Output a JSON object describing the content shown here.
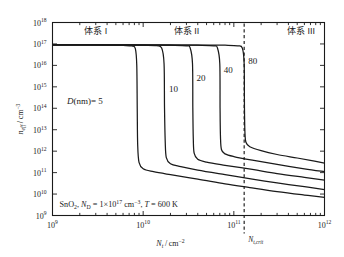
{
  "figure": {
    "top_caption": "",
    "background_color": "#ffffff",
    "line_color": "#1a1a1a"
  },
  "chart_data": {
    "type": "line",
    "title": "",
    "xlabel": "N_t / cm^-2",
    "ylabel": "n_eff / cm^-3",
    "xscale": "log",
    "yscale": "log",
    "xlim": [
      1000000000.0,
      1000000000000.0
    ],
    "ylim": [
      1000000000.0,
      1e+18
    ],
    "grid": false,
    "legend": "inline-annotations",
    "xtick_labels": [
      "10⁹",
      "10¹⁰",
      "10¹¹",
      "10¹²"
    ],
    "xtick_values": [
      1000000000.0,
      10000000000.0,
      100000000000.0,
      1000000000000.0
    ],
    "ytick_labels": [
      "10⁹",
      "10¹⁰",
      "10¹¹",
      "10¹²",
      "10¹³",
      "10¹⁴",
      "10¹⁵",
      "10¹⁶",
      "10¹⁷",
      "10¹⁸"
    ],
    "ytick_values": [
      1000000000.0,
      10000000000.0,
      100000000000.0,
      1000000000000.0,
      10000000000000.0,
      100000000000000.0,
      1000000000000000.0,
      1e+16,
      1e+17,
      1e+18
    ],
    "annotation": "SnO₂, Nᴅ = 1×10¹⁷ cm⁻³, T = 600 K",
    "annotation_parts": {
      "material": "SnO",
      "material_sub": "2",
      "donor_symbol": "N",
      "donor_sub": "D",
      "donor_value": " = 1×10",
      "donor_exp": "17",
      "donor_unit": " cm",
      "donor_unit_exp": "−3",
      "temp_symbol": "T",
      "temp_value": " = 600 K"
    },
    "critical_line": {
      "label": "N_t,crit",
      "label_symbol": "N",
      "label_sub": "t,crit",
      "value": 130000000000.0,
      "style": "dashed"
    },
    "regions": [
      {
        "name": "体系 I",
        "x_center": 3000000000.0
      },
      {
        "name": "体系 II",
        "x_center": 30000000000.0
      },
      {
        "name": "体系 III",
        "x_center": 550000000000.0
      }
    ],
    "series_label_prefix": "D(nm)=",
    "series": [
      {
        "name": "5",
        "label": "5",
        "plateau": 9e+16,
        "drop_x": 8500000000.0,
        "knee_y": 130000000000.0,
        "tail_end_y": 7000000000.0,
        "points": [
          [
            1000000000.0,
            9e+16
          ],
          [
            2000000000.0,
            9e+16
          ],
          [
            4000000000.0,
            8.8e+16
          ],
          [
            6000000000.0,
            8.5e+16
          ],
          [
            7500000000.0,
            8e+16
          ],
          [
            8200000000.0,
            6e+16
          ],
          [
            8500000000.0,
            1e+16
          ],
          [
            8600000000.0,
            100000000000000.0
          ],
          [
            8700000000.0,
            2000000000000.0
          ],
          [
            9000000000.0,
            300000000000.0
          ],
          [
            10000000000.0,
            150000000000.0
          ],
          [
            13000000000.0,
            110000000000.0
          ],
          [
            20000000000.0,
            80000000000.0
          ],
          [
            40000000000.0,
            50000000000.0
          ],
          [
            80000000000.0,
            30000000000.0
          ],
          [
            150000000000.0,
            20000000000.0
          ],
          [
            300000000000.0,
            13000000000.0
          ],
          [
            600000000000.0,
            9000000000.0
          ],
          [
            1000000000000.0,
            7000000000.0
          ]
        ]
      },
      {
        "name": "10",
        "label": "10",
        "plateau": 9e+16,
        "drop_x": 17000000000.0,
        "knee_y": 220000000000.0,
        "tail_end_y": 11000000000.0,
        "points": [
          [
            1000000000.0,
            9e+16
          ],
          [
            5000000000.0,
            8.9e+16
          ],
          [
            10000000000.0,
            8.7e+16
          ],
          [
            14000000000.0,
            8.3e+16
          ],
          [
            16000000000.0,
            6.5e+16
          ],
          [
            17000000000.0,
            1.2e+16
          ],
          [
            17200000000.0,
            100000000000000.0
          ],
          [
            17500000000.0,
            3000000000000.0
          ],
          [
            18000000000.0,
            500000000000.0
          ],
          [
            20000000000.0,
            260000000000.0
          ],
          [
            26000000000.0,
            190000000000.0
          ],
          [
            40000000000.0,
            130000000000.0
          ],
          [
            80000000000.0,
            80000000000.0
          ],
          [
            160000000000.0,
            50000000000.0
          ],
          [
            300000000000.0,
            33000000000.0
          ],
          [
            600000000000.0,
            22000000000.0
          ],
          [
            1000000000000.0,
            16000000000.0
          ]
        ]
      },
      {
        "name": "20",
        "label": "20",
        "plateau": 9e+16,
        "drop_x": 35000000000.0,
        "knee_y": 360000000000.0,
        "tail_end_y": 20000000000.0,
        "points": [
          [
            1000000000.0,
            9e+16
          ],
          [
            10000000000.0,
            8.9e+16
          ],
          [
            20000000000.0,
            8.7e+16
          ],
          [
            30000000000.0,
            8.2e+16
          ],
          [
            33000000000.0,
            6.5e+16
          ],
          [
            35000000000.0,
            1.2e+16
          ],
          [
            35300000000.0,
            100000000000000.0
          ],
          [
            35700000000.0,
            4000000000000.0
          ],
          [
            36500000000.0,
            800000000000.0
          ],
          [
            40000000000.0,
            420000000000.0
          ],
          [
            50000000000.0,
            310000000000.0
          ],
          [
            80000000000.0,
            220000000000.0
          ],
          [
            160000000000.0,
            140000000000.0
          ],
          [
            300000000000.0,
            90000000000.0
          ],
          [
            600000000000.0,
            60000000000.0
          ],
          [
            1000000000000.0,
            45000000000.0
          ]
        ]
      },
      {
        "name": "40",
        "label": "40",
        "plateau": 9e+16,
        "drop_x": 70000000000.0,
        "knee_y": 650000000000.0,
        "tail_end_y": 50000000000.0,
        "points": [
          [
            1000000000.0,
            9e+16
          ],
          [
            20000000000.0,
            8.9e+16
          ],
          [
            40000000000.0,
            8.7e+16
          ],
          [
            60000000000.0,
            8.2e+16
          ],
          [
            66000000000.0,
            6.5e+16
          ],
          [
            70000000000.0,
            1.2e+16
          ],
          [
            70500000000.0,
            100000000000000.0
          ],
          [
            71200000000.0,
            5000000000000.0
          ],
          [
            73000000000.0,
            1200000000000.0
          ],
          [
            80000000000.0,
            750000000000.0
          ],
          [
            100000000000.0,
            560000000000.0
          ],
          [
            160000000000.0,
            380000000000.0
          ],
          [
            300000000000.0,
            240000000000.0
          ],
          [
            600000000000.0,
            150000000000.0
          ],
          [
            1000000000000.0,
            110000000000.0
          ]
        ]
      },
      {
        "name": "80",
        "label": "80",
        "plateau": 9e+16,
        "drop_x": 130000000000.0,
        "knee_y": 1300000000000.0,
        "tail_end_y": 190000000000.0,
        "points": [
          [
            1000000000.0,
            9e+16
          ],
          [
            40000000000.0,
            8.9e+16
          ],
          [
            80000000000.0,
            8.7e+16
          ],
          [
            110000000000.0,
            8.2e+16
          ],
          [
            124000000000.0,
            6.5e+16
          ],
          [
            130000000000.0,
            1.2e+16
          ],
          [
            131000000000.0,
            100000000000000.0
          ],
          [
            132500000000.0,
            8000000000000.0
          ],
          [
            136000000000.0,
            2600000000000.0
          ],
          [
            150000000000.0,
            1600000000000.0
          ],
          [
            200000000000.0,
            1050000000000.0
          ],
          [
            300000000000.0,
            700000000000.0
          ],
          [
            500000000000.0,
            480000000000.0
          ],
          [
            750000000000.0,
            350000000000.0
          ],
          [
            1000000000000.0,
            280000000000.0
          ]
        ]
      }
    ]
  }
}
